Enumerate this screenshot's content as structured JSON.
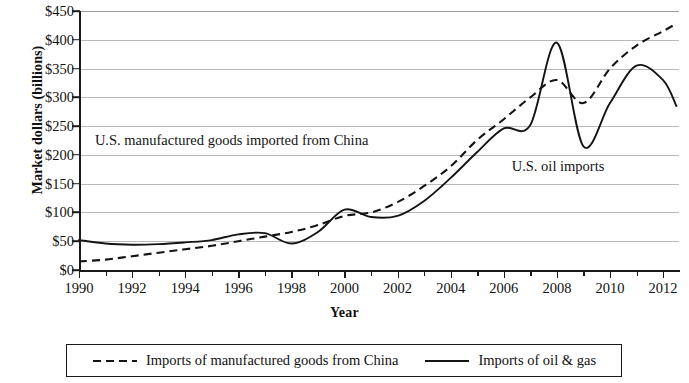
{
  "chart_data": {
    "type": "line",
    "title": "",
    "xlabel": "Year",
    "ylabel": "Market dollars (billions)",
    "xlim": [
      1990,
      2012.6
    ],
    "ylim": [
      0,
      450
    ],
    "ytick_step": 50,
    "grid": "horizontal",
    "legend_position": "bottom",
    "x_tick_labels": [
      "1990",
      "1992",
      "1994",
      "1996",
      "1998",
      "2000",
      "2002",
      "2004",
      "2006",
      "2008",
      "2010",
      "2012"
    ],
    "x_tick_values": [
      1990,
      1992,
      1994,
      1996,
      1998,
      2000,
      2002,
      2004,
      2006,
      2008,
      2010,
      2012
    ],
    "x_minor_ticks": [
      1991,
      1993,
      1995,
      1997,
      1999,
      2001,
      2003,
      2005,
      2007,
      2009,
      2011
    ],
    "y_tick_labels": [
      "$0",
      "$50",
      "$100",
      "$150",
      "$200",
      "$250",
      "$300",
      "$350",
      "$400",
      "$450"
    ],
    "y_tick_values": [
      0,
      50,
      100,
      150,
      200,
      250,
      300,
      350,
      400,
      450
    ],
    "series": [
      {
        "name": "Imports of manufactured goods from China",
        "style": "dashed",
        "color": "#141414",
        "x": [
          1990,
          1991,
          1992,
          1993,
          1994,
          1995,
          1996,
          1997,
          1998,
          1999,
          2000,
          2001,
          2002,
          2003,
          2004,
          2005,
          2006,
          2007,
          2008,
          2009,
          2010,
          2011,
          2012,
          2012.5
        ],
        "values": [
          15,
          18,
          24,
          30,
          36,
          42,
          50,
          58,
          66,
          78,
          94,
          100,
          118,
          146,
          180,
          226,
          262,
          300,
          330,
          290,
          350,
          390,
          415,
          428
        ]
      },
      {
        "name": "Imports of oil & gas",
        "style": "solid",
        "color": "#141414",
        "x": [
          1990,
          1991,
          1992,
          1993,
          1994,
          1995,
          1996,
          1997,
          1998,
          1999,
          2000,
          2001,
          2002,
          2003,
          2004,
          2005,
          2006,
          2007,
          2008,
          2009,
          2010,
          2011,
          2012,
          2012.5
        ],
        "values": [
          52,
          46,
          44,
          45,
          48,
          52,
          62,
          64,
          46,
          66,
          105,
          92,
          94,
          120,
          160,
          205,
          246,
          252,
          395,
          215,
          290,
          355,
          330,
          285
        ]
      }
    ],
    "annotations": [
      {
        "text": "U.S. manufactured goods imported from China",
        "x": 1990.6,
        "y": 222
      },
      {
        "text": "U.S. oil imports",
        "x": 2006.3,
        "y": 178
      }
    ]
  },
  "axis": {
    "y_title": "Market dollars (billions)",
    "x_title": "Year"
  },
  "legend": {
    "entries": [
      {
        "label": "Imports of manufactured goods from China",
        "style": "dashed"
      },
      {
        "label": "Imports of oil & gas",
        "style": "solid"
      }
    ]
  }
}
